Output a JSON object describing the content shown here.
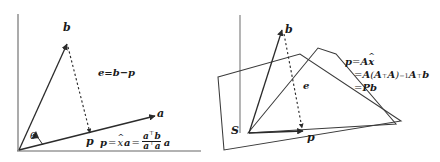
{
  "figure": {
    "title_semantic": "orthogonal-projection-diagram",
    "stroke_color": "#2b2b2b",
    "axis_color": "#555555",
    "text_color": "#1a1a1a"
  },
  "left_panel": {
    "name": "projection-onto-line",
    "labels": {
      "vector_b": "b",
      "vector_a": "a",
      "point_p": "p",
      "angle": "θ",
      "error": "e=b−p"
    },
    "equation": {
      "lhs": "p",
      "eq1": "=",
      "xhat": "x",
      "hat": "^",
      "times_a": "a",
      "eq2": "=",
      "numerator": "a",
      "numerator_sup": "⊤",
      "numerator_tail": "b",
      "denominator": "a",
      "denominator_sup": "⊤",
      "denominator_tail": "a",
      "trailing_a": "a"
    }
  },
  "right_panel": {
    "name": "projection-onto-subspace",
    "labels": {
      "vector_b": "b",
      "point_p": "p",
      "error": "e",
      "subspace": "S"
    },
    "equation": {
      "line1_lhs": "p",
      "line1_eq": "=",
      "line1_A": "A",
      "line1_xhat": "x",
      "line1_hat": "^",
      "line2_eq": "=",
      "line2_A": "A",
      "line2_open": "(",
      "line2_At": "A",
      "line2_At_sup": "⊤",
      "line2_A2": "A",
      "line2_close": ")",
      "line2_inv": "−1",
      "line2_A3": "A",
      "line2_A3_sup": "⊤",
      "line2_b": "b",
      "line3_eq": "=",
      "line3_P": "P",
      "line3_b": "b"
    }
  }
}
